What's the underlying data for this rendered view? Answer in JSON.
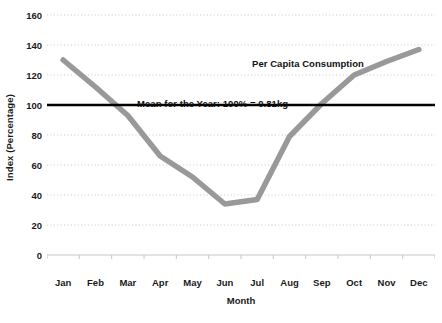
{
  "chart_data": {
    "type": "line",
    "title": "",
    "subtitle": "",
    "xlabel": "Month",
    "ylabel": "Index (Percentage)",
    "categories": [
      "Jan",
      "Feb",
      "Mar",
      "Apr",
      "May",
      "Jun",
      "Jul",
      "Aug",
      "Sep",
      "Oct",
      "Nov",
      "Dec"
    ],
    "series": [
      {
        "name": "Per Capita Consumption",
        "color": "#999999",
        "values": [
          130,
          112,
          93,
          66,
          52,
          34,
          37,
          79,
          101,
          120,
          129,
          137
        ]
      }
    ],
    "reference_lines": [
      {
        "name": "Mean for the Year",
        "label": "Mean for the Year: 100% = 0.81kg",
        "value": 100,
        "color": "#000000"
      }
    ],
    "annotations": [
      {
        "name": "series-label",
        "text": "Per Capita Consumption"
      },
      {
        "name": "mean-label",
        "text": "Mean for the Year: 100% = 0.81kg"
      }
    ],
    "ylim": [
      0,
      160
    ],
    "yticks": [
      0,
      20,
      40,
      60,
      80,
      100,
      120,
      140,
      160
    ],
    "ytick_labels": [
      "0",
      "20",
      "40",
      "60",
      "80",
      "100",
      "120",
      "140",
      "160"
    ],
    "grid": true,
    "grid_axis": "y",
    "grid_style": "dotted",
    "grid_color": "#cfcfcf",
    "legend": false,
    "legend_position": "none",
    "axis_color": "#c8c8c8",
    "background": "#ffffff"
  }
}
